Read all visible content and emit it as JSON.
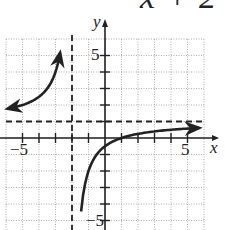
{
  "title_fragment": "x + 2",
  "chart_data": {
    "type": "line",
    "title": "x + 2",
    "function": "y = 1 - 3/(x + 2)",
    "xlabel": "x",
    "ylabel": "y",
    "xlim": [
      -6,
      6
    ],
    "ylim": [
      -5,
      6
    ],
    "grid": true,
    "x_tick_labels": [
      "-5",
      "5"
    ],
    "y_tick_labels": [
      "5",
      "-5"
    ],
    "asymptotes": {
      "vertical": -2,
      "horizontal": 1
    },
    "series": [
      {
        "name": "left branch",
        "x": [
          -6,
          -5,
          -4,
          -3,
          -2.75
        ],
        "y": [
          1.75,
          2,
          2.5,
          4,
          5
        ]
      },
      {
        "name": "right branch",
        "x": [
          -1.5,
          -1,
          0,
          1,
          2,
          3,
          4,
          5,
          5.5
        ],
        "y": [
          -5,
          -2,
          -0.5,
          0,
          0.25,
          0.4,
          0.5,
          0.57,
          0.6
        ]
      }
    ]
  },
  "labels": {
    "x_axis": "x",
    "y_axis": "y",
    "xneg5": "−5",
    "xpos5": "5",
    "ypos5": "5",
    "yneg5": "−5"
  }
}
